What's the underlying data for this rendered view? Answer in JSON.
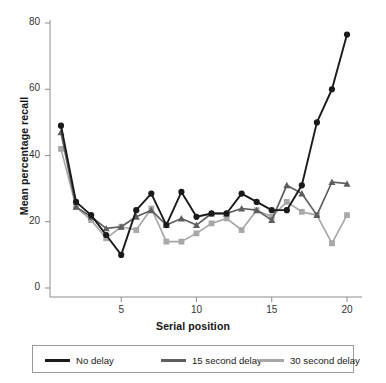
{
  "chart_data": {
    "type": "line",
    "title": "",
    "xlabel": "Serial position",
    "ylabel": "Mean percentage recall",
    "x": [
      1,
      2,
      3,
      4,
      5,
      6,
      7,
      8,
      9,
      10,
      11,
      12,
      13,
      14,
      15,
      16,
      17,
      18,
      19,
      20
    ],
    "xlim": [
      0.4,
      20.6
    ],
    "ylim": [
      0,
      84
    ],
    "xticks": [
      5,
      10,
      15,
      20
    ],
    "xtick_labels": [
      "5",
      "10",
      "15",
      "20"
    ],
    "yticks": [
      0,
      20,
      40,
      60,
      80
    ],
    "ytick_labels": [
      "0",
      "20",
      "40",
      "60",
      "80"
    ],
    "grid": false,
    "legend_position": "below",
    "series": [
      {
        "name": "No delay",
        "color": "#1a1a1a",
        "marker": "circle",
        "values": [
          49,
          26,
          22,
          16,
          10,
          23.5,
          28.5,
          19,
          29,
          21.5,
          22.5,
          22.5,
          28.5,
          26,
          23.5,
          23.5,
          31,
          50,
          60,
          76.5
        ]
      },
      {
        "name": "15 second delay",
        "color": "#5e5e5e",
        "marker": "triangle",
        "values": [
          47,
          24.5,
          21.5,
          18,
          18.5,
          21.5,
          23.5,
          19,
          21,
          19,
          22.5,
          22.5,
          24,
          23.5,
          20.5,
          31,
          28.5,
          22,
          32,
          31.5
        ]
      },
      {
        "name": "30 second delay",
        "color": "#a8a8a8",
        "marker": "square",
        "values": [
          42,
          24.5,
          20.5,
          15,
          18.5,
          17.5,
          24,
          14,
          14,
          16.5,
          19.5,
          21,
          17.5,
          23.5,
          21.5,
          26,
          23,
          22,
          13.5,
          22
        ]
      }
    ]
  },
  "legend": {
    "items": [
      {
        "label": "No delay",
        "color": "#1a1a1a"
      },
      {
        "label": "15 second delay",
        "color": "#5e5e5e"
      },
      {
        "label": "30 second delay",
        "color": "#a8a8a8"
      }
    ]
  },
  "axes": {
    "x_title": "Serial position",
    "y_title": "Mean percentage recall"
  }
}
